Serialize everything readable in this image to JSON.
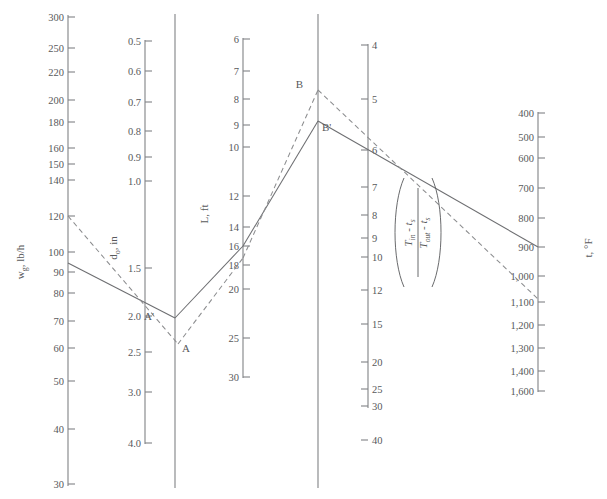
{
  "figure": {
    "kind": "nomograph",
    "background": "#ffffff",
    "line_color": "#808285",
    "solid_iso_color": "#6d6e71",
    "dashed_iso_color": "#8c8d8f"
  },
  "axes": [
    {
      "id": "wg",
      "name": "gas-flow-axis",
      "title": "w",
      "title_sub": "g",
      "title_rest": ", lb/h",
      "title_full": "w g , lb/h",
      "unit": "lb/h",
      "direction": "decreasing-down",
      "x": 68,
      "y_top": 15,
      "y_bottom": 486,
      "tick_side": "right",
      "ticks": [
        {
          "label": "300",
          "y": 17
        },
        {
          "label": "250",
          "y": 48
        },
        {
          "label": "220",
          "y": 72
        },
        {
          "label": "200",
          "y": 100
        },
        {
          "label": "180",
          "y": 122
        },
        {
          "label": "160",
          "y": 148
        },
        {
          "label": "150",
          "y": 164
        },
        {
          "label": "140",
          "y": 180
        },
        {
          "label": "120",
          "y": 216
        },
        {
          "label": "100",
          "y": 252
        },
        {
          "label": "90",
          "y": 272
        },
        {
          "label": "80",
          "y": 293
        },
        {
          "label": "70",
          "y": 321
        },
        {
          "label": "60",
          "y": 348
        },
        {
          "label": "50",
          "y": 381
        },
        {
          "label": "40",
          "y": 429
        },
        {
          "label": "30",
          "y": 484
        }
      ]
    },
    {
      "id": "d",
      "name": "diameter-axis",
      "title": "d",
      "title_sub": "o",
      "title_rest": ", in",
      "title_full": "d o , in",
      "unit": "in",
      "direction": "increasing-down",
      "x": 145,
      "y_top": 40,
      "y_bottom": 444,
      "tick_side": "right",
      "ticks": [
        {
          "label": "0.5",
          "y": 41
        },
        {
          "label": "0.6",
          "y": 71
        },
        {
          "label": "0.7",
          "y": 102
        },
        {
          "label": "0.8",
          "y": 131
        },
        {
          "label": "0.9",
          "y": 157
        },
        {
          "label": "1.0",
          "y": 181
        },
        {
          "label": "1.5",
          "y": 268
        },
        {
          "label": "2.0",
          "y": 316
        },
        {
          "label": "2.5",
          "y": 352
        },
        {
          "label": "3.0",
          "y": 392
        },
        {
          "label": "4.0",
          "y": 443
        }
      ]
    },
    {
      "id": "L",
      "name": "length-axis",
      "title": "L, ft",
      "title_full": "L, ft",
      "unit": "ft",
      "direction": "increasing-down",
      "x": 243,
      "y_top": 38,
      "y_bottom": 378,
      "tick_side": "right",
      "ticks": [
        {
          "label": "6",
          "y": 39
        },
        {
          "label": "7",
          "y": 71
        },
        {
          "label": "8",
          "y": 99
        },
        {
          "label": "9",
          "y": 125
        },
        {
          "label": "10",
          "y": 147
        },
        {
          "label": "12",
          "y": 196
        },
        {
          "label": "14",
          "y": 227
        },
        {
          "label": "16",
          "y": 246
        },
        {
          "label": "18",
          "y": 265
        },
        {
          "label": "20",
          "y": 289
        },
        {
          "label": "25",
          "y": 338
        },
        {
          "label": "30",
          "y": 377
        }
      ]
    },
    {
      "id": "ratio",
      "name": "temperature-ratio-axis",
      "title_kind": "fraction",
      "numerator": "T_in - t_s",
      "denominator": "T_out - t_s",
      "numerator_main": "T",
      "numerator_sub": "in",
      "numerator_rest": " - t",
      "numerator_sub2": "s",
      "denominator_main": "T",
      "denominator_sub": "out",
      "denominator_rest": " - t",
      "denominator_sub2": "s",
      "direction": "increasing-down",
      "x": 368,
      "y_top": 44,
      "y_bottom": 408,
      "tick_side": "left",
      "ticks": [
        {
          "label": "4",
          "y": 45
        },
        {
          "label": "5",
          "y": 99
        },
        {
          "label": "6",
          "y": 150
        },
        {
          "label": "7",
          "y": 187
        },
        {
          "label": "8",
          "y": 215
        },
        {
          "label": "9",
          "y": 238
        },
        {
          "label": "10",
          "y": 257
        },
        {
          "label": "12",
          "y": 290
        },
        {
          "label": "15",
          "y": 324
        },
        {
          "label": "20",
          "y": 362
        },
        {
          "label": "25",
          "y": 389
        },
        {
          "label": "30",
          "y": 406
        },
        {
          "label": "40",
          "y": 440
        }
      ]
    },
    {
      "id": "t",
      "name": "temperature-axis",
      "title": "t, °F",
      "title_full": "t, °F",
      "unit": "°F",
      "direction": "increasing-down",
      "x": 538,
      "y_top": 112,
      "y_bottom": 392,
      "tick_side": "right",
      "ticks": [
        {
          "label": "400",
          "y": 113
        },
        {
          "label": "500",
          "y": 137
        },
        {
          "label": "600",
          "y": 158
        },
        {
          "label": "700",
          "y": 188
        },
        {
          "label": "800",
          "y": 218
        },
        {
          "label": "900",
          "y": 247
        },
        {
          "label": "1,000",
          "y": 276
        },
        {
          "label": "1,100",
          "y": 302
        },
        {
          "label": "1,200",
          "y": 325
        },
        {
          "label": "1,300",
          "y": 348
        },
        {
          "label": "1,400",
          "y": 371
        },
        {
          "label": "1,600",
          "y": 391
        }
      ]
    }
  ],
  "pivot_lines": [
    {
      "name": "pivot-line-left",
      "x": 175,
      "y_top": 14,
      "y_bottom": 488
    },
    {
      "name": "pivot-line-right",
      "x": 318,
      "y_top": 14,
      "y_bottom": 488
    }
  ],
  "points": [
    {
      "label": "A",
      "name": "point-a",
      "x": 178,
      "y": 344,
      "lx": 182,
      "ly": 352
    },
    {
      "label": "A'",
      "name": "point-a-prime",
      "x": 175,
      "y": 318,
      "lx": 154,
      "ly": 320
    },
    {
      "label": "B",
      "name": "point-b",
      "x": 318,
      "y": 90,
      "lx": 303,
      "ly": 88
    },
    {
      "label": "B'",
      "name": "point-b-prime",
      "x": 318,
      "y": 121,
      "lx": 322,
      "ly": 131
    }
  ],
  "isopleths": [
    {
      "name": "isopleth-solid",
      "style": "solid",
      "description": "solid construction line through A' and B'",
      "segments": [
        {
          "x1": 68,
          "y1": 263,
          "x2": 175,
          "y2": 318
        },
        {
          "x1": 175,
          "y1": 318,
          "x2": 243,
          "y2": 246
        },
        {
          "x1": 243,
          "y1": 246,
          "x2": 318,
          "y2": 121
        },
        {
          "x1": 318,
          "y1": 121,
          "x2": 538,
          "y2": 247
        }
      ]
    },
    {
      "name": "isopleth-dashed",
      "style": "dashed",
      "description": "dashed construction line through A and B",
      "segments": [
        {
          "x1": 68,
          "y1": 216,
          "x2": 178,
          "y2": 344
        },
        {
          "x1": 178,
          "y1": 344,
          "x2": 243,
          "y2": 258
        },
        {
          "x1": 243,
          "y1": 258,
          "x2": 318,
          "y2": 90
        },
        {
          "x1": 318,
          "y1": 90,
          "x2": 538,
          "y2": 299
        }
      ]
    }
  ],
  "chart_data": {
    "type": "line",
    "title": "",
    "xlabel": "",
    "ylabel": "",
    "series": [
      {
        "name": "solid isopleth",
        "readings": {
          "wg_lb_per_h": 94,
          "d_o_in": 1.9,
          "L_ft": 16,
          "ratio": 5.6,
          "t_degF": 900
        }
      },
      {
        "name": "dashed isopleth",
        "readings": {
          "wg_lb_per_h": 120,
          "d_o_in": 2.2,
          "L_ft": 17,
          "ratio": 4.8,
          "t_degF": 1100
        }
      }
    ],
    "axis_ranges": {
      "wg_lb_per_h": [
        30,
        300
      ],
      "d_o_in": [
        0.5,
        4.0
      ],
      "L_ft": [
        6,
        30
      ],
      "ratio": [
        4,
        40
      ],
      "t_degF": [
        400,
        1600
      ]
    },
    "grid": false,
    "legend_position": "none"
  }
}
